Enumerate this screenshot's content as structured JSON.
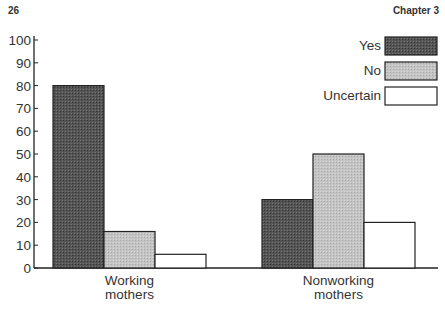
{
  "header": {
    "page_number": "26",
    "chapter": "Chapter 3"
  },
  "colors": {
    "yes": "#4a4a4a",
    "no": "#bdbdbd",
    "uncertain": "#ffffff",
    "stroke": "#222222"
  },
  "chart_data": {
    "type": "bar",
    "title": "",
    "xlabel": "",
    "ylabel": "",
    "categories": [
      "Working mothers",
      "Nonworking mothers"
    ],
    "category_lines": [
      [
        "Working",
        "mothers"
      ],
      [
        "Nonworking",
        "mothers"
      ]
    ],
    "series": [
      {
        "name": "Yes",
        "values": [
          80,
          30
        ]
      },
      {
        "name": "No",
        "values": [
          16,
          50
        ]
      },
      {
        "name": "Uncertain",
        "values": [
          6,
          20
        ]
      }
    ],
    "ylim": [
      0,
      100
    ],
    "yticks": [
      0,
      10,
      20,
      30,
      40,
      50,
      60,
      70,
      80,
      90,
      100
    ],
    "grid": false,
    "legend_position": "upper right"
  }
}
